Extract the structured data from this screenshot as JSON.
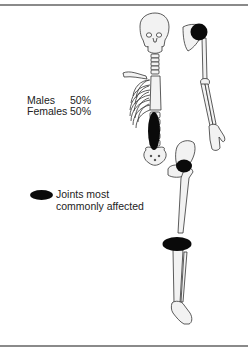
{
  "figure": {
    "stats": [
      {
        "label": "Males",
        "value": "50%"
      },
      {
        "label": "Females",
        "value": "50%"
      }
    ],
    "legend": {
      "line1": "Joints most",
      "line2": "commonly affected",
      "swatch_color": "#0a0a0a"
    },
    "highlighted_joints": [
      "shoulder",
      "lumbar spine",
      "hip",
      "knee"
    ],
    "colors": {
      "bone_fill": "#f2f2f2",
      "bone_stroke": "#333333",
      "highlight": "#0a0a0a",
      "rule": "#8a8a8a"
    }
  }
}
